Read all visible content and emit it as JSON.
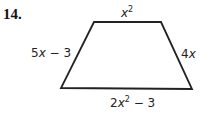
{
  "problem_number": "14.",
  "shape": "trapezoid",
  "sides": {
    "top": {
      "var": "x",
      "exp": "2",
      "rest": ""
    },
    "left": {
      "coef": "5",
      "var": "x",
      "rest": " − 3"
    },
    "right": {
      "coef": "4",
      "var": "x"
    },
    "bottom": {
      "coef": "2",
      "var": "x",
      "exp": "2",
      "rest": " − 3"
    }
  }
}
